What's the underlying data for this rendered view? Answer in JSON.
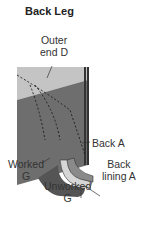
{
  "title": "Back Leg",
  "labels": {
    "outer_end": [
      "Outer",
      "end D"
    ],
    "back": "Back A",
    "back_lining": [
      "Back",
      "lining A"
    ],
    "worked": [
      "Worked",
      "G"
    ],
    "unworked": [
      "Unworked",
      "G"
    ]
  },
  "colors": {
    "light_panel": "#bfbfbf",
    "dark_panel": "#6f6f6f",
    "leg_dark": "#5a5a5a",
    "stripe_light": "#d8d8d8"
  }
}
